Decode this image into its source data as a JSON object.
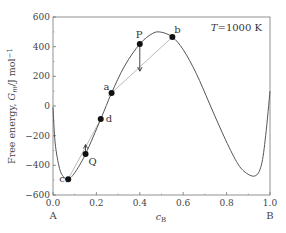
{
  "chart_data": {
    "type": "line",
    "title": "",
    "annotation": "T=1000 K",
    "xlabel": "c_B",
    "ylabel": "Free energy, G_m/J mol^-1",
    "xlim": [
      0.0,
      1.0
    ],
    "ylim": [
      -600,
      600
    ],
    "xticks": [
      "0.0",
      "0.2",
      "0.4",
      "0.6",
      "0.8",
      "1.0"
    ],
    "yticks": [
      "600",
      "400",
      "200",
      "0",
      "-200",
      "-400",
      "-600"
    ],
    "x_end_labels": {
      "left": "A",
      "right": "B"
    },
    "grid": false,
    "legend": null,
    "series": [
      {
        "name": "G_m curve",
        "x": [
          0.0,
          0.01,
          0.03,
          0.05,
          0.07,
          0.1,
          0.15,
          0.22,
          0.27,
          0.33,
          0.4,
          0.46,
          0.5,
          0.55,
          0.6,
          0.66,
          0.72,
          0.78,
          0.84,
          0.88,
          0.93,
          0.96,
          0.98,
          1.0
        ],
        "values": [
          -10,
          -250,
          -420,
          -480,
          -493,
          -450,
          -324,
          -88,
          88,
          270,
          418,
          490,
          497,
          465,
          380,
          220,
          20,
          -180,
          -360,
          -440,
          -472,
          -400,
          -200,
          100
        ]
      }
    ],
    "points": [
      {
        "label": "c",
        "x": 0.07,
        "y": -493
      },
      {
        "label": "Q",
        "x": 0.15,
        "y": -324
      },
      {
        "label": "d",
        "x": 0.22,
        "y": -88
      },
      {
        "label": "a",
        "x": 0.27,
        "y": 88
      },
      {
        "label": "P",
        "x": 0.4,
        "y": 418
      },
      {
        "label": "b",
        "x": 0.55,
        "y": 465
      }
    ],
    "tangent_lines": [
      {
        "from": "a",
        "to": "b"
      },
      {
        "from": "c",
        "to": "d"
      }
    ],
    "arrows": [
      {
        "from_point": "P",
        "direction": "down",
        "to_y": 235
      },
      {
        "from_point": "Q",
        "direction": "up",
        "to_y": -260
      }
    ]
  }
}
